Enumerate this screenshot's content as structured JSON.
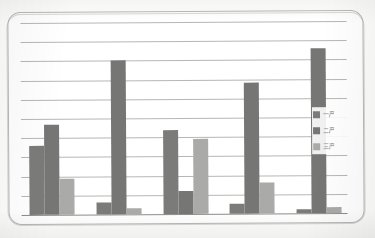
{
  "chart_data": {
    "type": "bar",
    "title": "",
    "subtitle": "",
    "xlabel": "",
    "ylabel": "",
    "grid": true,
    "gridline_count": 11,
    "legend_position": "right",
    "ylim": [
      0,
      1
    ],
    "categories": [
      "1",
      "2",
      "3",
      "4",
      "5"
    ],
    "tick_labels": [],
    "series": [
      {
        "name": "一产",
        "color": "#7b7b79",
        "values": [
          0.36,
          0.06,
          0.44,
          0.05,
          0.02
        ]
      },
      {
        "name": "二产",
        "color": "#767674",
        "values": [
          0.47,
          0.8,
          0.12,
          0.68,
          0.86
        ]
      },
      {
        "name": "三产",
        "color": "#aaaaa8",
        "values": [
          0.19,
          0.03,
          0.39,
          0.16,
          0.03
        ]
      }
    ],
    "annotations": []
  },
  "legend": {
    "items": [
      {
        "label": "一产",
        "color": "#7b7b79"
      },
      {
        "label": "二产",
        "color": "#767674"
      },
      {
        "label": "三产",
        "color": "#aaaaa8"
      }
    ]
  },
  "colors": {
    "series_1": "#7b7b79",
    "series_2": "#767674",
    "series_3": "#aaaaa8",
    "gridline": "#a9a9a7",
    "axis": "#8d8d8b",
    "frame_border": "#b9b9b6",
    "plot_background": "#ffffff",
    "page_background": "#fdfdfc"
  }
}
